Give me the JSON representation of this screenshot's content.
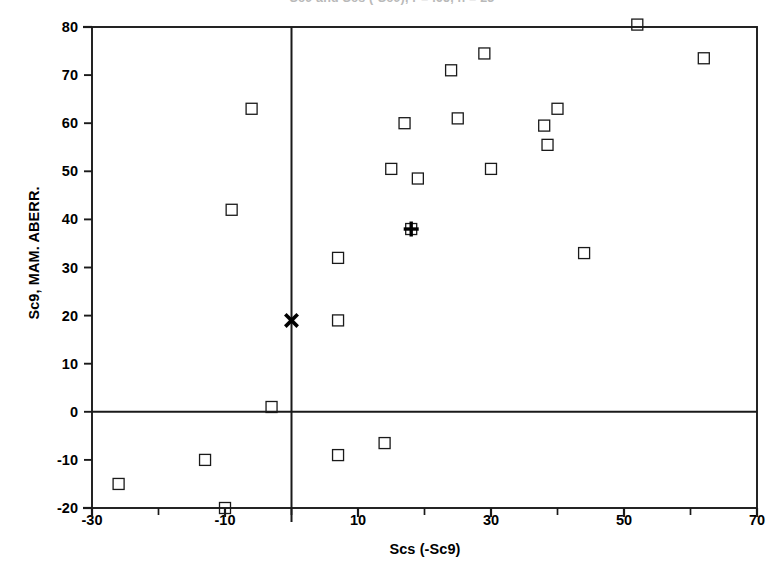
{
  "chart_data": {
    "type": "scatter",
    "title": "Sc9 and Scs (-Sc9), r = .65, n = 23",
    "xlabel": "Scs (-Sc9)",
    "ylabel": "Sc9, MAM. ABERR.",
    "xlim": [
      -30,
      70
    ],
    "ylim": [
      -20,
      80
    ],
    "xticks": [
      -30,
      -10,
      10,
      30,
      50,
      70
    ],
    "xticks_minor": [
      -20,
      0,
      20,
      40,
      60
    ],
    "yticks": [
      -20,
      -10,
      0,
      10,
      20,
      30,
      40,
      50,
      60,
      70,
      80
    ],
    "xtick_labels": [
      "-30",
      "-10",
      "10",
      "30",
      "50",
      "70"
    ],
    "ytick_labels": [
      "80",
      "70",
      "60",
      "50",
      "40",
      "30",
      "20",
      "10",
      "0",
      "-10",
      "-20"
    ],
    "grid": false,
    "legend": "none",
    "reference_lines": [
      {
        "name": "x-zero-vertical",
        "axis": "x",
        "value": 0
      },
      {
        "name": "y-zero-horizontal",
        "axis": "y",
        "value": 0
      }
    ],
    "series": [
      {
        "name": "observations",
        "marker": "open-square",
        "color": "#1a1a1a",
        "points": [
          {
            "x": -26,
            "y": -15
          },
          {
            "x": -13,
            "y": -10
          },
          {
            "x": -10,
            "y": -20
          },
          {
            "x": -9,
            "y": 42
          },
          {
            "x": -6,
            "y": 63
          },
          {
            "x": -3,
            "y": 1
          },
          {
            "x": 7,
            "y": 32
          },
          {
            "x": 7,
            "y": 19
          },
          {
            "x": 7,
            "y": -9
          },
          {
            "x": 14,
            "y": -6.5
          },
          {
            "x": 15,
            "y": 50.5
          },
          {
            "x": 17,
            "y": 60
          },
          {
            "x": 18,
            "y": 38
          },
          {
            "x": 19,
            "y": 48.5
          },
          {
            "x": 24,
            "y": 71
          },
          {
            "x": 25,
            "y": 61
          },
          {
            "x": 29,
            "y": 74.5
          },
          {
            "x": 30,
            "y": 50.5
          },
          {
            "x": 38,
            "y": 59.5
          },
          {
            "x": 38.5,
            "y": 55.5
          },
          {
            "x": 40,
            "y": 63
          },
          {
            "x": 44,
            "y": 33
          },
          {
            "x": 52,
            "y": 80.5
          },
          {
            "x": 62,
            "y": 73.5
          }
        ]
      },
      {
        "name": "mean-marker",
        "marker": "bold-plus",
        "color": "#000000",
        "points": [
          {
            "x": 18,
            "y": 38
          }
        ]
      },
      {
        "name": "reference-marker",
        "marker": "bold-x",
        "color": "#000000",
        "points": [
          {
            "x": 0,
            "y": 19
          }
        ]
      }
    ]
  },
  "axes": {
    "frame_color": "#1a1a1a",
    "tick_color": "#1a1a1a"
  }
}
